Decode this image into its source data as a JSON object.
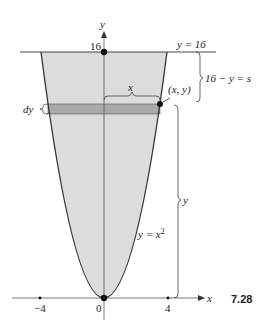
{
  "figure": {
    "number": "7.28",
    "axes": {
      "x_label": "x",
      "y_label": "y",
      "x_ticks": [
        "−4",
        "0",
        "4"
      ],
      "y_ticks": [
        "16"
      ]
    },
    "curve_label": "y = x²",
    "curve_label_base": "y = x",
    "curve_label_exp": "2",
    "top_line_label": "y = 16",
    "point_label": "(x, y)",
    "strip_height_label": "dy",
    "strip_halfwidth_label": "x",
    "upper_brace_label": "16 − y = s",
    "lower_brace_label": "y",
    "colors": {
      "region_fill": "#dcdcdc",
      "strip_fill": "#a9a9a9",
      "lines": "#333333"
    }
  }
}
